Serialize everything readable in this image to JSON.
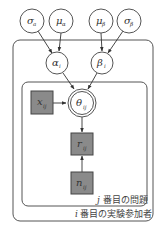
{
  "diagram": {
    "type": "graphical-model",
    "colors": {
      "observed_fill": "#8a8a8a",
      "stroke": "#555555",
      "background": "#ffffff"
    },
    "nodes": {
      "sigma_alpha": {
        "symbol": "σ",
        "sub": "a",
        "kind": "latent"
      },
      "mu_alpha": {
        "symbol": "μ",
        "sub": "α",
        "kind": "latent"
      },
      "mu_beta": {
        "symbol": "μ",
        "sub": "β",
        "kind": "latent"
      },
      "sigma_beta": {
        "symbol": "σ",
        "sub": "β",
        "kind": "latent"
      },
      "alpha_i": {
        "symbol": "α",
        "sub": "i",
        "kind": "latent"
      },
      "beta_i": {
        "symbol": "β",
        "sub": "i",
        "kind": "latent"
      },
      "x_ij": {
        "symbol": "x",
        "sub": "ij",
        "kind": "observed"
      },
      "theta_ij": {
        "symbol": "θ",
        "sub": "ij",
        "kind": "deterministic"
      },
      "r_ij": {
        "symbol": "r",
        "sub": "ij",
        "kind": "observed"
      },
      "n_ij": {
        "symbol": "n",
        "sub": "ij",
        "kind": "observed"
      }
    },
    "edges": [
      [
        "sigma_alpha",
        "alpha_i"
      ],
      [
        "mu_alpha",
        "alpha_i"
      ],
      [
        "mu_beta",
        "beta_i"
      ],
      [
        "sigma_beta",
        "beta_i"
      ],
      [
        "alpha_i",
        "theta_ij"
      ],
      [
        "beta_i",
        "theta_ij"
      ],
      [
        "x_ij",
        "theta_ij"
      ],
      [
        "theta_ij",
        "r_ij"
      ],
      [
        "n_ij",
        "r_ij"
      ]
    ],
    "plates": {
      "inner": {
        "index": "j",
        "label": "番目の問題"
      },
      "outer": {
        "index": "i",
        "label": "番目の実験参加者"
      }
    }
  }
}
